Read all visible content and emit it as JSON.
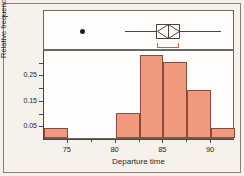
{
  "chart_data": {
    "type": "bar",
    "title": "",
    "subtitle": "",
    "xlabel": "Departure time",
    "ylabel": "Relative frequency",
    "xlim": [
      72.5,
      92.5
    ],
    "ylim": [
      0,
      0.35
    ],
    "grid": false,
    "legend": null,
    "xticks": [
      75,
      80,
      85,
      90
    ],
    "xtick_labels": [
      "75",
      "80",
      "85",
      "90"
    ],
    "yticks": [
      0.05,
      0.15,
      0.25
    ],
    "ytick_labels": [
      "0.05",
      "0.15",
      "0.25"
    ],
    "ytick_minor": [
      0.1,
      0.2,
      0.3
    ],
    "bin_width": 2.5,
    "bins": [
      {
        "left": 72.5,
        "right": 75.0,
        "value": 0.04
      },
      {
        "left": 75.0,
        "right": 77.5,
        "value": 0.0
      },
      {
        "left": 77.5,
        "right": 80.0,
        "value": 0.0
      },
      {
        "left": 80.0,
        "right": 82.5,
        "value": 0.1
      },
      {
        "left": 82.5,
        "right": 85.0,
        "value": 0.325
      },
      {
        "left": 85.0,
        "right": 87.5,
        "value": 0.3
      },
      {
        "left": 87.5,
        "right": 90.0,
        "value": 0.19
      },
      {
        "left": 90.0,
        "right": 92.5,
        "value": 0.04
      }
    ],
    "boxplot": {
      "whisker_low": 81.0,
      "q1": 84.2,
      "median": 85.5,
      "q3": 86.7,
      "whisker_high": 91.0,
      "mean": 85.5,
      "outliers": [
        76.5
      ],
      "ci_low": 84.3,
      "ci_high": 86.6
    },
    "colors": {
      "bar_fill": "#ef9a7e",
      "bar_edge": "#8d4a38",
      "axis": "#4a4540",
      "background": "#f7f1ec",
      "panel": "#fffdfb",
      "ci_marker": "#e8503a",
      "outlier": "#231f1d"
    }
  }
}
